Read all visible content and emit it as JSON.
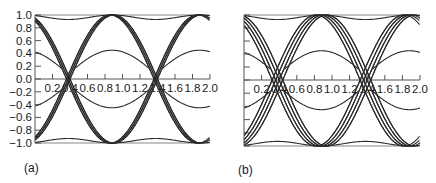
{
  "chart_data": [
    {
      "type": "line",
      "panel_label": "(a)",
      "title": "",
      "xlabel": "",
      "ylabel": "",
      "xlim": [
        0,
        2.0
      ],
      "ylim": [
        -1.0,
        1.0
      ],
      "x_ticks": [
        "0.2",
        "0.4",
        "0.6",
        "0.8",
        "1.0",
        "1.2",
        "1.4",
        "1.6",
        "1.8",
        "2.0"
      ],
      "y_ticks": [
        "1.0",
        "0.8",
        "0.6",
        "0.4",
        "0.2",
        "0.0",
        "-0.2",
        "-0.4",
        "-0.6",
        "-0.8",
        "-1.0"
      ],
      "grid": false,
      "description": "Eye diagram: overlaid symbol-period traces with tight zero-crossings near x=0.38 and x=1.38",
      "crossings_x": [
        0.38,
        1.38
      ],
      "series": [
        {
          "name": "outer-high",
          "peak_y": 1.0,
          "peak_x": [
            0.88,
            1.88
          ]
        },
        {
          "name": "outer-low",
          "peak_y": -1.0,
          "peak_x": [
            0.88,
            1.88
          ]
        },
        {
          "name": "inner-high",
          "peak_y": 0.45,
          "peak_x": [
            0.88,
            1.88
          ]
        },
        {
          "name": "inner-low",
          "peak_y": -0.45,
          "peak_x": [
            0.88,
            1.88
          ]
        },
        {
          "name": "transition-rising",
          "start_y": -0.75,
          "end_y": 0.75
        },
        {
          "name": "transition-falling",
          "start_y": 0.75,
          "end_y": -0.75
        }
      ],
      "jitter_spread": 0.02
    },
    {
      "type": "line",
      "panel_label": "(b)",
      "title": "",
      "xlabel": "",
      "ylabel": "",
      "xlim": [
        0,
        2.0
      ],
      "ylim": [
        -1.0,
        1.0
      ],
      "x_ticks": [
        "0.2",
        "0.4",
        "0.6",
        "0.8",
        "1.0",
        "1.2",
        "1.4",
        "1.6",
        "1.8",
        "2.0"
      ],
      "y_ticks": [],
      "grid": false,
      "description": "Eye diagram with wider crossing spread (timing jitter) near x=0.38 and x=1.38",
      "crossings_x": [
        0.38,
        1.38
      ],
      "series": [
        {
          "name": "outer-high",
          "peak_y": 1.0,
          "peak_x": [
            0.88,
            1.88
          ]
        },
        {
          "name": "outer-low",
          "peak_y": -1.0,
          "peak_x": [
            0.88,
            1.88
          ]
        },
        {
          "name": "inner-high",
          "peak_y": 0.45,
          "peak_x": [
            0.88,
            1.88
          ]
        },
        {
          "name": "inner-low",
          "peak_y": -0.45,
          "peak_x": [
            0.88,
            1.88
          ]
        },
        {
          "name": "transition-rising",
          "start_y": -0.75,
          "end_y": 0.75
        },
        {
          "name": "transition-falling",
          "start_y": 0.75,
          "end_y": -0.75
        }
      ],
      "jitter_spread": 0.06
    }
  ],
  "colors": {
    "trace": "#2a2a2a",
    "axis": "#555555"
  }
}
